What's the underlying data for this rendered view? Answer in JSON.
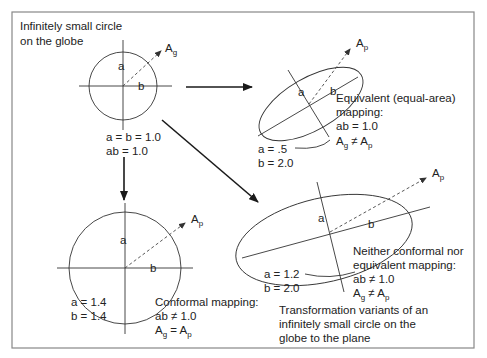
{
  "figure": {
    "title": [
      "Infinitely small circle",
      "on the globe"
    ],
    "caption": [
      "Transformation variants of an",
      "infinitely small circle on the",
      "globe to the plane"
    ]
  },
  "globe": {
    "label_a": "a",
    "label_b": "b",
    "area_label": "A",
    "area_sub": "g",
    "values": [
      "a = b = 1.0",
      "ab = 1.0"
    ]
  },
  "equivalent": {
    "label_a": "a",
    "label_b": "b",
    "area_label": "A",
    "area_sub": "p",
    "values": [
      "a = .5",
      "b = 2.0"
    ],
    "description": [
      "Equivalent (equal-area)",
      " mapping:",
      "ab = 1.0"
    ],
    "relation": {
      "left": "A",
      "left_sub": "g",
      "op": " ≠ ",
      "right": "A",
      "right_sub": "p"
    }
  },
  "conformal": {
    "label_a": "a",
    "label_b": "b",
    "area_label": "A",
    "area_sub": "p",
    "values": [
      "a = 1.4",
      "b = 1.4"
    ],
    "description": [
      "Conformal mapping:",
      "ab ≠ 1.0"
    ],
    "relation": {
      "left": "A",
      "left_sub": "g",
      "op": " = ",
      "right": "A",
      "right_sub": "p"
    }
  },
  "neither": {
    "label_a": "a",
    "label_b": "b",
    "area_label": "A",
    "area_sub": "p",
    "values": [
      "a = 1.2",
      "b = 2.0"
    ],
    "description": [
      "Neither conformal nor",
      "equivalent mapping:",
      "ab ≠ 1.0"
    ],
    "relation": {
      "left": "A",
      "left_sub": "g",
      "op": " ≠ ",
      "right": "A",
      "right_sub": "p"
    }
  },
  "colors": {
    "line": "#333333",
    "frame": "#888888",
    "text": "#222222"
  }
}
